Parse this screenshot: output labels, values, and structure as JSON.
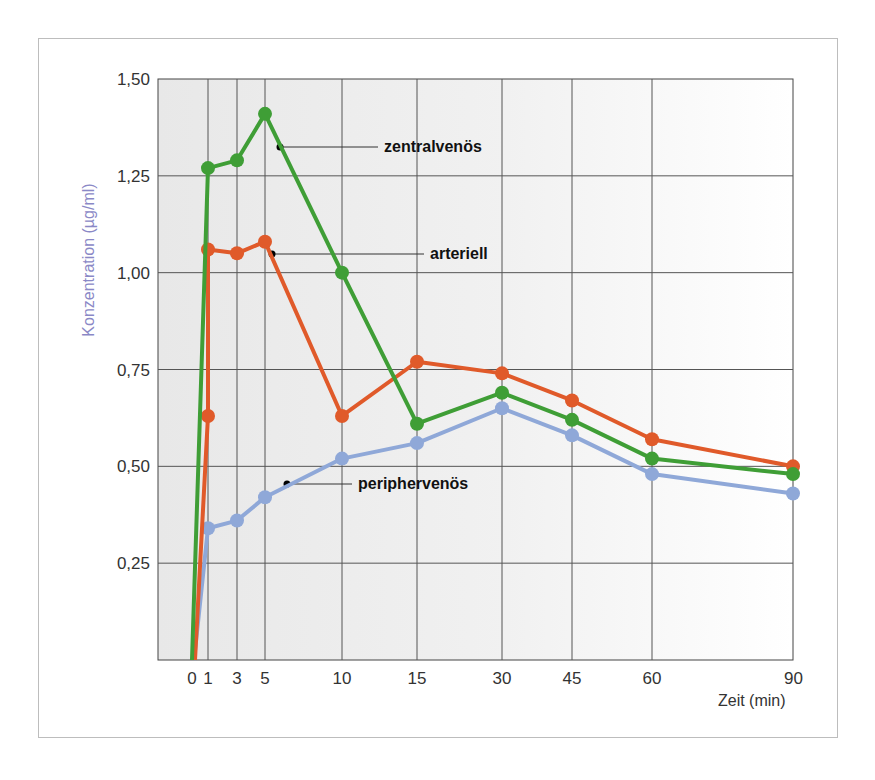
{
  "chart_data": {
    "type": "line",
    "title": "",
    "xlabel": "Zeit (min)",
    "ylabel": "Konzentration (µg/ml)",
    "ylim": [
      0,
      1.5
    ],
    "y_ticks": [
      "0,25",
      "0,50",
      "0,75",
      "1,00",
      "1,25",
      "1,50"
    ],
    "x": [
      0,
      1,
      3,
      5,
      10,
      15,
      30,
      45,
      60,
      90
    ],
    "x_tick_labels": [
      "0",
      "1",
      "3",
      "5",
      "10",
      "15",
      "30",
      "45",
      "60",
      "90"
    ],
    "grid": true,
    "legend_position": "inline annotations",
    "series": [
      {
        "name": "zentralvenös",
        "color": "#3f9e36",
        "values": [
          0,
          1.27,
          1.29,
          1.41,
          1.0,
          0.61,
          0.69,
          0.62,
          0.52,
          0.48
        ]
      },
      {
        "name": "arteriell",
        "color": "#e05a2a",
        "values": [
          0,
          0.63,
          1.06,
          1.05,
          1.08,
          0.63,
          0.77,
          0.74,
          0.67,
          0.57,
          0.5
        ],
        "x": [
          0,
          1,
          1,
          3,
          5,
          10,
          15,
          30,
          45,
          60,
          90
        ]
      },
      {
        "name": "periphervenös",
        "color": "#8fa8d8",
        "values": [
          0,
          0.34,
          0.36,
          0.42,
          0.52,
          0.56,
          0.65,
          0.58,
          0.48,
          0.43
        ]
      }
    ]
  },
  "labels": {
    "zentral": "zentralvenös",
    "arteriell": "arteriell",
    "peripher": "periphervenös",
    "xaxis": "Zeit (min)",
    "yaxis": "Konzentration (µg/ml)"
  }
}
